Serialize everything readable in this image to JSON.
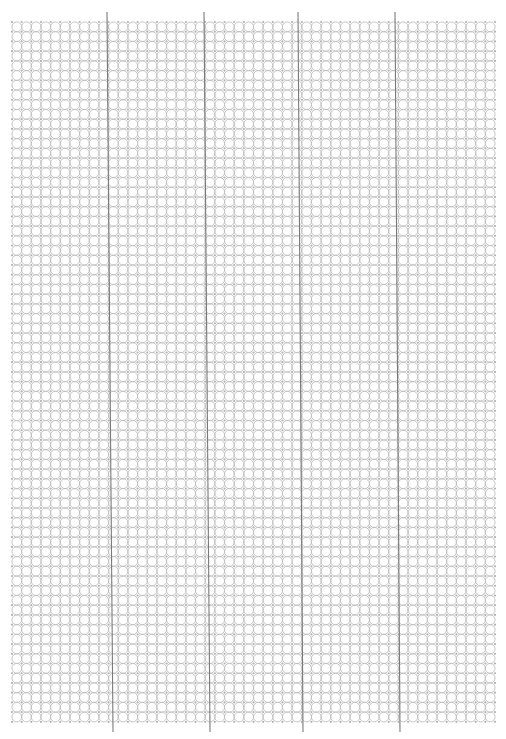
{
  "page": {
    "width": 506,
    "height": 739,
    "background": "#ffffff"
  },
  "circle_grid": {
    "left": 12,
    "top": 22,
    "columns": 50,
    "rows": 72,
    "pitch_x": 9.66,
    "pitch_y": 9.72,
    "radius": 4.9,
    "stroke_color": "#bdbdbd",
    "stroke_width": 0.9,
    "node_color": "#b0b0b0"
  },
  "vertical_lines": {
    "color": "#7a7a7a",
    "width": 1.1,
    "top_y": 12,
    "bottom_y": 732,
    "lines": [
      {
        "x_top": 107,
        "x_bottom": 113
      },
      {
        "x_top": 204,
        "x_bottom": 210
      },
      {
        "x_top": 298,
        "x_bottom": 303
      },
      {
        "x_top": 395,
        "x_bottom": 400
      }
    ]
  }
}
